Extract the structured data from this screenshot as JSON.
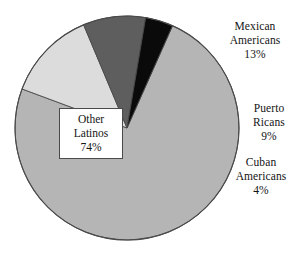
{
  "chart_data": {
    "type": "pie",
    "title": "",
    "subtitle": "",
    "xlabel": "",
    "ylabel": "",
    "legend_position": "none",
    "grid": false,
    "categories": [
      "Other Latinos",
      "Mexican Americans",
      "Puerto Ricans",
      "Cuban Americans"
    ],
    "values": [
      74,
      13,
      9,
      4
    ],
    "unit": "%",
    "slices": [
      {
        "name": "Other Latinos",
        "value": 74,
        "value_label": "74%",
        "label_line1": "Other",
        "label_line2": "Latinos",
        "label_line3": "74%",
        "color": "#b5b5b5",
        "label_placement": "inside-boxed"
      },
      {
        "name": "Mexican Americans",
        "value": 13,
        "value_label": "13%",
        "label_line1": "Mexican",
        "label_line2": "Americans",
        "label_line3": "13%",
        "color": "#dcdcdc",
        "label_placement": "outside-right"
      },
      {
        "name": "Puerto Ricans",
        "value": 9,
        "value_label": "9%",
        "label_line1": "Puerto",
        "label_line2": "Ricans",
        "label_line3": "9%",
        "color": "#5e5e5e",
        "label_placement": "outside-right"
      },
      {
        "name": "Cuban Americans",
        "value": 4,
        "value_label": "4%",
        "label_line1": "Cuban",
        "label_line2": "Americans",
        "label_line3": "4%",
        "color": "#0a0a0a",
        "label_placement": "outside-right"
      }
    ],
    "geometry": {
      "center_x": 127,
      "center_y": 128,
      "radius": 112,
      "start_angle_deg": -66,
      "direction": "clockwise"
    },
    "outline_color": "#4a4a4a"
  }
}
